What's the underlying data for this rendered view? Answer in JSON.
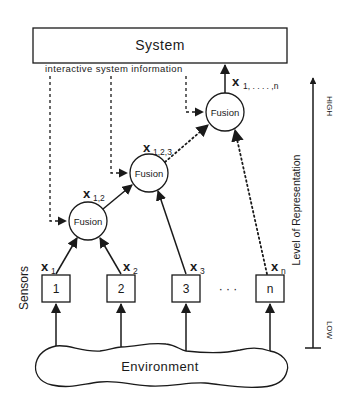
{
  "diagram": {
    "system": {
      "label": "System"
    },
    "feedback": {
      "label": "interactive system information"
    },
    "fusion_nodes": [
      {
        "id": "fusion-1",
        "label": "Fusion",
        "output_var": "x",
        "output_sub": "1,2"
      },
      {
        "id": "fusion-2",
        "label": "Fusion",
        "output_var": "x",
        "output_sub": "1,2,3"
      },
      {
        "id": "fusion-3",
        "label": "Fusion",
        "output_var": "x",
        "output_sub": "1, . . . . ,n"
      }
    ],
    "sensors": {
      "group_label": "Sensors",
      "items": [
        {
          "label": "1",
          "var": "x",
          "sub": "1"
        },
        {
          "label": "2",
          "var": "x",
          "sub": "2"
        },
        {
          "label": "3",
          "var": "x",
          "sub": "3"
        },
        {
          "label": "n",
          "var": "x",
          "sub": "n"
        }
      ],
      "ellipsis": "· · ·"
    },
    "environment": {
      "label": "Environment"
    },
    "axis": {
      "label": "Level of Representation",
      "high": "HIGH",
      "low": "LOW"
    }
  }
}
